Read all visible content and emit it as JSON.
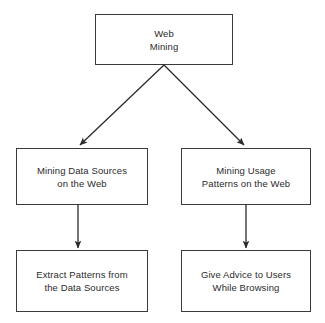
{
  "diagram": {
    "background_color": "#ffffff",
    "line_color": "#3a3a3a",
    "text_color": "#2b2b2b",
    "nodes": [
      {
        "id": "web-mining",
        "line1": "Web",
        "line2": "Mining",
        "x": 95,
        "y": 14,
        "width": 138,
        "height": 51
      },
      {
        "id": "mining-data-sources",
        "line1": "Mining Data Sources",
        "line2": "on the Web",
        "x": 16,
        "y": 148,
        "width": 132,
        "height": 57
      },
      {
        "id": "mining-usage-patterns",
        "line1": "Mining Usage",
        "line2": "Patterns on the Web",
        "x": 181,
        "y": 148,
        "width": 130,
        "height": 57
      },
      {
        "id": "extract-patterns",
        "line1": "Extract Patterns from",
        "line2": "the Data Sources",
        "x": 16,
        "y": 250,
        "width": 132,
        "height": 62
      },
      {
        "id": "give-advice",
        "line1": "Give Advice to Users",
        "line2": "While Browsing",
        "x": 181,
        "y": 250,
        "width": 130,
        "height": 62
      }
    ],
    "edges": [
      {
        "id": "edge-web-mining-to-data-sources",
        "from": "web-mining",
        "to": "mining-data-sources",
        "kind": "diagonal-arrow",
        "x1": 164,
        "y1": 65,
        "x2": 80,
        "y2": 145
      },
      {
        "id": "edge-web-mining-to-usage-patterns",
        "from": "web-mining",
        "to": "mining-usage-patterns",
        "kind": "diagonal-arrow",
        "x1": 164,
        "y1": 65,
        "x2": 244,
        "y2": 145
      },
      {
        "id": "edge-data-sources-to-extract-patterns",
        "from": "mining-data-sources",
        "to": "extract-patterns",
        "kind": "vertical-arrow",
        "x1": 78,
        "y1": 205,
        "x2": 78,
        "y2": 248
      },
      {
        "id": "edge-usage-patterns-to-give-advice",
        "from": "mining-usage-patterns",
        "to": "give-advice",
        "kind": "vertical-arrow",
        "x1": 246,
        "y1": 205,
        "x2": 246,
        "y2": 248
      }
    ]
  }
}
